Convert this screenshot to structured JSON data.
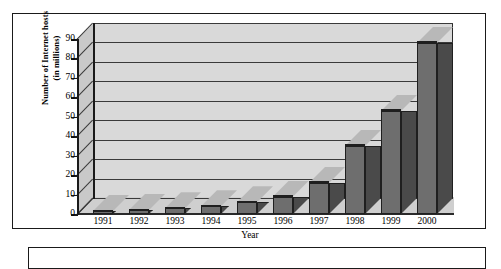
{
  "figure": {
    "ytitle_line1": "Number of Internet hosts",
    "ytitle_line2": "(in millions)",
    "xtitle": "Year",
    "frame_color": "#1a1a1a",
    "plot_background": "#d9d9d9",
    "bar_front_color": "#6e6e6e",
    "bar_top_color": "#b8b8b8",
    "bar_side_color": "#4a4a4a"
  },
  "chart_data": {
    "type": "bar",
    "title": "",
    "xlabel": "Year",
    "ylabel": "Number of Internet hosts (in millions)",
    "categories": [
      "1991",
      "1992",
      "1993",
      "1994",
      "1995",
      "1996",
      "1997",
      "1998",
      "1999",
      "2000"
    ],
    "values": [
      1,
      2,
      3,
      4,
      6,
      9,
      16,
      35,
      53,
      88
    ],
    "ylim": [
      0,
      90
    ],
    "yticks": [
      0,
      10,
      20,
      30,
      40,
      50,
      60,
      70,
      80,
      90
    ],
    "ytick_labels": [
      "0",
      "10",
      "20",
      "30",
      "40",
      "50",
      "60",
      "70",
      "80",
      "90"
    ],
    "grid": true,
    "grid_axis": "y",
    "legend": false,
    "style": "3d-column"
  }
}
